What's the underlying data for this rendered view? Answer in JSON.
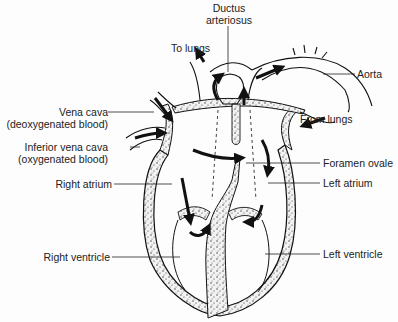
{
  "diagram": {
    "labels": {
      "ductus_line1": "Ductus",
      "ductus_line2": "arteriosus",
      "to_lungs": "To lungs",
      "aorta": "Aorta",
      "vena_cava_line1": "Vena cava",
      "vena_cava_line2": "(deoxygenated blood)",
      "ivc_line1": "Inferior vena cava",
      "ivc_line2": "(oxygenated blood)",
      "from_lungs": "From lungs",
      "foramen_ovale": "Foramen ovale",
      "right_atrium": "Right atrium",
      "left_atrium": "Left atrium",
      "right_ventricle": "Right ventricle",
      "left_ventricle": "Left ventricle"
    },
    "colors": {
      "ink": "#1a1a1a",
      "tissue": "#d9d9d9",
      "background": "#fdfdfd"
    }
  }
}
